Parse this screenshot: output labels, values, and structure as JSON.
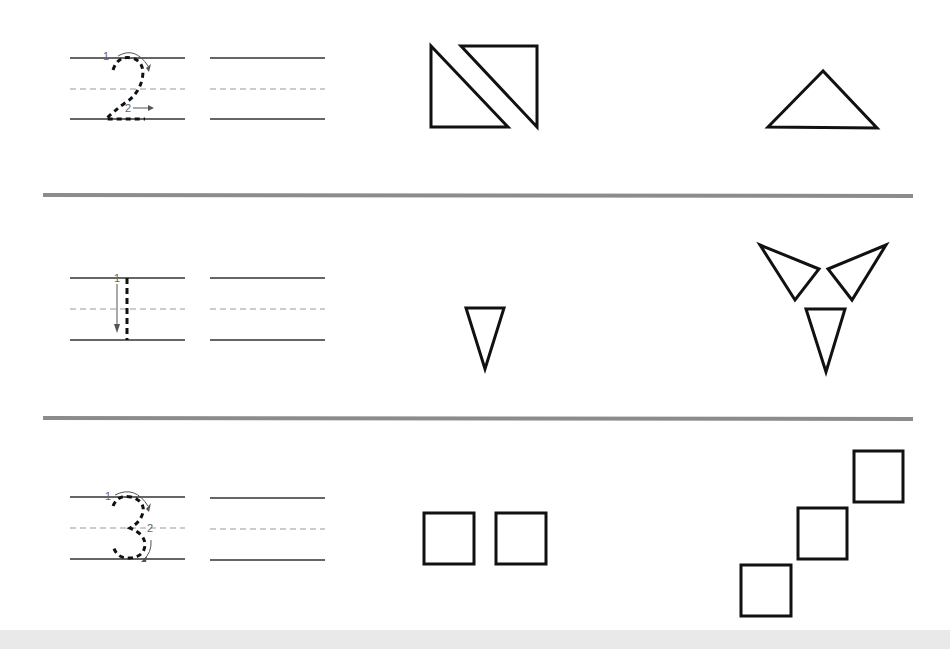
{
  "worksheet": {
    "type": "number-tracing-and-shapes",
    "colors": {
      "background": "#ffffff",
      "line": "#333333",
      "guide_dashed": "#999999",
      "divider": "#8c8c8c",
      "footer_band": "#e9e9e9",
      "arrow": "#555555",
      "shape_stroke": "#111111"
    },
    "rows": [
      {
        "number": "2",
        "stroke_labels": [
          "1",
          "2"
        ],
        "shapes_left": {
          "kind": "triangle",
          "count": 2,
          "description": "two right triangles forming a split rectangle"
        },
        "shapes_right": {
          "kind": "triangle",
          "count": 1,
          "description": "one wide triangle"
        }
      },
      {
        "number": "1",
        "stroke_labels": [
          "1"
        ],
        "shapes_left": {
          "kind": "triangle",
          "count": 1,
          "description": "one inverted triangle"
        },
        "shapes_right": {
          "kind": "triangle",
          "count": 3,
          "description": "three triangles arranged in a pinwheel"
        }
      },
      {
        "number": "3",
        "stroke_labels": [
          "1",
          "2"
        ],
        "shapes_left": {
          "kind": "square",
          "count": 2,
          "description": "two squares side by side"
        },
        "shapes_right": {
          "kind": "square",
          "count": 3,
          "description": "three squares in a diagonal staircase"
        }
      }
    ]
  }
}
